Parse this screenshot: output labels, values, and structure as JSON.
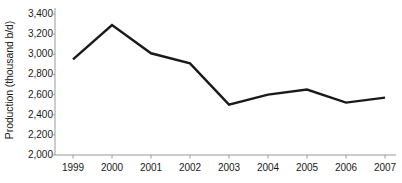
{
  "chart_data": {
    "type": "line",
    "title": "",
    "xlabel": "",
    "ylabel": "Production (thousand b/d)",
    "categories": [
      "1999",
      "2000",
      "2001",
      "2002",
      "2003",
      "2004",
      "2005",
      "2006",
      "2007"
    ],
    "values": [
      2950,
      3290,
      3010,
      2910,
      2500,
      2600,
      2650,
      2520,
      2570
    ],
    "series": [
      {
        "name": "Production",
        "values": [
          2950,
          3290,
          3010,
          2910,
          2500,
          2600,
          2650,
          2520,
          2570
        ],
        "color": "#1a1a1a"
      }
    ],
    "ylim": [
      2000,
      3400
    ],
    "yticks": [
      2000,
      2200,
      2400,
      2600,
      2800,
      3000,
      3200,
      3400
    ],
    "ytick_labels": [
      "2,000",
      "2,200",
      "2,400",
      "2,600",
      "2,800",
      "3,000",
      "3,200",
      "3,400"
    ],
    "xtick_labels": [
      "1999",
      "2000",
      "2001",
      "2002",
      "2003",
      "2004",
      "2005",
      "2006",
      "2007"
    ],
    "grid": false,
    "legend": "none",
    "line_color": "#1a1a1a",
    "axis_color": "#9a9a9a",
    "background_color": "#ffffff"
  },
  "axes": {
    "y_title": "Production (thousand b/d)"
  }
}
